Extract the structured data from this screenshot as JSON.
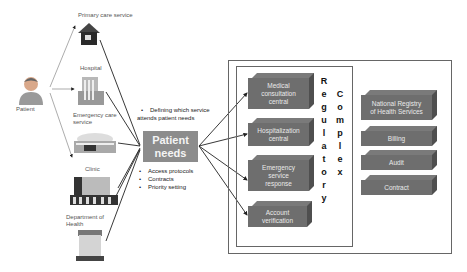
{
  "patient": {
    "label": "Patient"
  },
  "services": [
    {
      "label": "Primary care service",
      "icon": "house-icon"
    },
    {
      "label": "Hospital",
      "icon": "hospital-building-icon"
    },
    {
      "label": "Emergency care service",
      "label_lines": [
        "Emergency care",
        "service"
      ],
      "icon": "emergency-building-icon"
    },
    {
      "label": "Clinic",
      "icon": "clinic-building-icon"
    },
    {
      "label": "Department of Health",
      "label_lines": [
        "Department of",
        "Health"
      ],
      "icon": "department-building-icon"
    }
  ],
  "center": {
    "title_lines": [
      "Patient",
      "needs"
    ],
    "top_bullets": [
      "Defining which service",
      "attends patient needs"
    ],
    "bottom_bullets": [
      "Access protocols",
      "Contracts",
      "Priority setting"
    ]
  },
  "regulatory": {
    "vertical_label_1": [
      "R",
      "e",
      "g",
      "u",
      "l",
      "a",
      "t",
      "o",
      "r",
      "y"
    ],
    "vertical_label_2": [
      "C",
      "o",
      "m",
      "p",
      "l",
      "e",
      "x"
    ],
    "boxes": [
      {
        "lines": [
          "Medical",
          "consultation",
          "central"
        ]
      },
      {
        "lines": [
          "Hospitalization",
          "central"
        ]
      },
      {
        "lines": [
          "Emergency",
          "service",
          "response"
        ]
      },
      {
        "lines": [
          "Account",
          "verification"
        ]
      }
    ]
  },
  "complex_boxes": [
    {
      "lines": [
        "National Registry",
        "of Health Services"
      ]
    },
    {
      "lines": [
        "Billing"
      ]
    },
    {
      "lines": [
        "Audit"
      ]
    },
    {
      "lines": [
        "Contract"
      ]
    }
  ],
  "colors": {
    "box_face": "#6e6e6e",
    "needs_box": "#8c8c8c",
    "line": "#222222",
    "frame": "#666666"
  }
}
